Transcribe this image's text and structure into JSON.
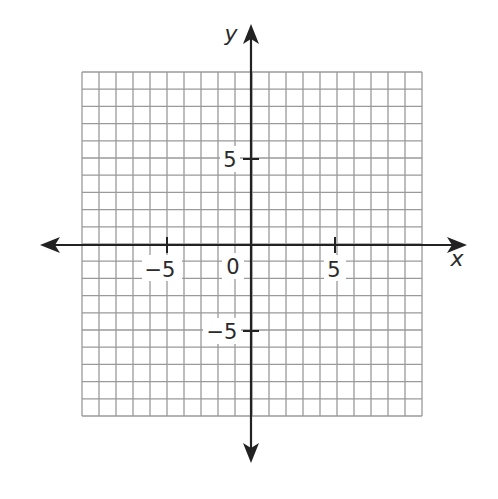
{
  "figure": {
    "type": "coordinate-plane",
    "x_range": [
      -10,
      10
    ],
    "y_range": [
      -10,
      10
    ],
    "grid_step": 1,
    "grid_color": "#9a9a9a",
    "axis_color": "#222222"
  },
  "axes": {
    "x_label": "x",
    "y_label": "y",
    "x_ticks": [
      {
        "value": -5,
        "label": "−5"
      },
      {
        "value": 5,
        "label": "5"
      }
    ],
    "y_ticks": [
      {
        "value": 5,
        "label": "5"
      },
      {
        "value": -5,
        "label": "−5"
      }
    ],
    "origin_label": "0"
  }
}
